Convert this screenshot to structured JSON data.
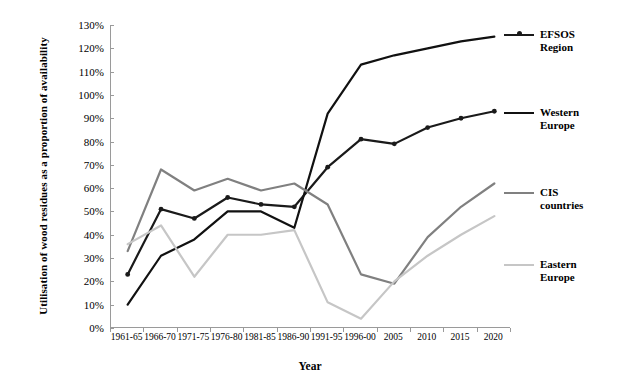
{
  "chart_data": {
    "type": "line",
    "title": "",
    "xlabel": "Year",
    "ylabel": "Utilisation of wood residues as a proportion of availability",
    "categories": [
      "1961-65",
      "1966-70",
      "1971-75",
      "1976-80",
      "1981-85",
      "1986-90",
      "1991-95",
      "1996-00",
      "2005",
      "2010",
      "2015",
      "2020"
    ],
    "yticks": [
      "0%",
      "10%",
      "20%",
      "30%",
      "40%",
      "50%",
      "60%",
      "70%",
      "80%",
      "90%",
      "100%",
      "110%",
      "120%",
      "130%"
    ],
    "ytick_values": [
      0,
      10,
      20,
      30,
      40,
      50,
      60,
      70,
      80,
      90,
      100,
      110,
      120,
      130
    ],
    "ylim": [
      0,
      130
    ],
    "grid": false,
    "legend_position": "right",
    "series": [
      {
        "name": "EFSOS Region",
        "label_line1": "EFSOS",
        "label_line2": "Region",
        "color": "#1a1a1a",
        "markers": true,
        "values": [
          23,
          51,
          47,
          56,
          53,
          52,
          69,
          81,
          79,
          86,
          90,
          93
        ]
      },
      {
        "name": "Western Europe",
        "label_line1": "Western",
        "label_line2": "Europe",
        "color": "#111111",
        "markers": false,
        "values": [
          10,
          31,
          38,
          50,
          50,
          43,
          92,
          113,
          117,
          120,
          123,
          125
        ]
      },
      {
        "name": "CIS countries",
        "label_line1": "CIS",
        "label_line2": "countries",
        "color": "#808080",
        "markers": false,
        "values": [
          33,
          68,
          59,
          64,
          59,
          62,
          53,
          23,
          19,
          39,
          52,
          62
        ]
      },
      {
        "name": "Eastern Europe",
        "label_line1": "Eastern",
        "label_line2": "Europe",
        "color": "#c6c6c6",
        "markers": false,
        "values": [
          36,
          44,
          22,
          40,
          40,
          42,
          11,
          4,
          20,
          31,
          40,
          48
        ]
      }
    ]
  }
}
